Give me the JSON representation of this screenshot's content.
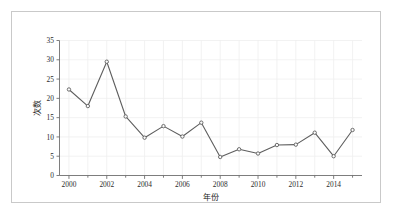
{
  "figure": {
    "background_color": "#ffffff",
    "frame_color": "#c9c9c9"
  },
  "chart_data": {
    "type": "line",
    "title": "",
    "xlabel": "年份",
    "ylabel": "次数",
    "x": [
      2000,
      2001,
      2002,
      2003,
      2004,
      2005,
      2006,
      2007,
      2008,
      2009,
      2010,
      2011,
      2012,
      2013,
      2014,
      2015
    ],
    "values": [
      22.3,
      18.0,
      29.5,
      15.3,
      9.8,
      12.8,
      10.1,
      13.7,
      4.8,
      6.8,
      5.7,
      7.9,
      8.0,
      11.1,
      5.0,
      11.8
    ],
    "series": [
      {
        "name": "次数",
        "values": [
          22.3,
          18.0,
          29.5,
          15.3,
          9.8,
          12.8,
          10.1,
          13.7,
          4.8,
          6.8,
          5.7,
          7.9,
          8.0,
          11.1,
          5.0,
          11.8
        ]
      }
    ],
    "xlim": [
      1999.5,
      2015.5
    ],
    "ylim": [
      0,
      35
    ],
    "xticks": [
      2000,
      2002,
      2004,
      2006,
      2008,
      2010,
      2012,
      2014
    ],
    "xtick_labels": [
      "2000",
      "2002",
      "2004",
      "2006",
      "2008",
      "2010",
      "2012",
      "2014"
    ],
    "xticks_minor": [
      2001,
      2003,
      2005,
      2007,
      2009,
      2011,
      2013,
      2015
    ],
    "yticks": [
      0,
      5,
      10,
      15,
      20,
      25,
      30,
      35
    ],
    "ytick_labels": [
      "0",
      "5",
      "10",
      "15",
      "20",
      "25",
      "30",
      "35"
    ],
    "grid": true,
    "grid_color": "#efefef",
    "legend": false,
    "legend_position": "none",
    "line_color": "#5e5e5e",
    "marker": "circle",
    "marker_face_color": "#fbfbfb"
  }
}
